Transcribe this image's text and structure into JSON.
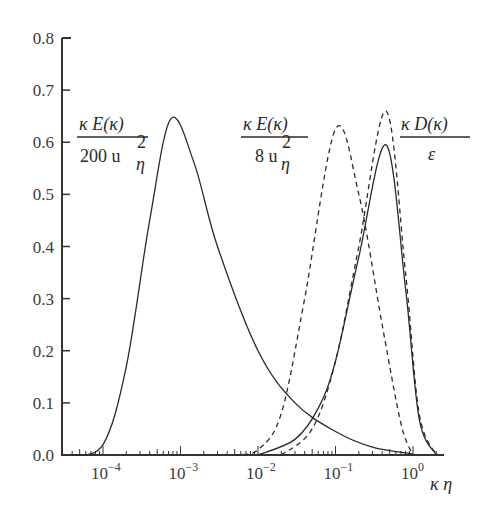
{
  "chart_data": {
    "type": "line",
    "title": "",
    "xlabel": "κ η",
    "ylabel": "",
    "xscale": "log",
    "xlim": [
      3e-05,
      3
    ],
    "ylim": [
      0.0,
      0.8
    ],
    "grid": false,
    "legend": "none (inline labels)",
    "y_ticks": [
      "0.0",
      "0.1",
      "0.2",
      "0.3",
      "0.4",
      "0.5",
      "0.6",
      "0.7",
      "0.8"
    ],
    "x_ticks": [
      {
        "base": "10",
        "exp": "−4",
        "value": 0.0001
      },
      {
        "base": "10",
        "exp": "−3",
        "value": 0.001
      },
      {
        "base": "10",
        "exp": "−2",
        "value": 0.01
      },
      {
        "base": "10",
        "exp": "−1",
        "value": 0.1
      },
      {
        "base": "10",
        "exp": "0",
        "value": 1
      }
    ],
    "series": [
      {
        "name": "κE(κ)/(200 u_η²) — high Re",
        "style": "solid",
        "label": {
          "num": "κ E(κ)",
          "den": "200 u",
          "den_sup": "2",
          "den_sub": "η"
        },
        "peak": {
          "x": 0.00075,
          "y": 0.645
        },
        "points": [
          [
            4e-05,
            0.0
          ],
          [
            0.0001,
            0.02
          ],
          [
            0.0002,
            0.17
          ],
          [
            0.0004,
            0.45
          ],
          [
            0.00075,
            0.645
          ],
          [
            0.0015,
            0.56
          ],
          [
            0.003,
            0.4
          ],
          [
            0.01,
            0.2
          ],
          [
            0.03,
            0.1
          ],
          [
            0.1,
            0.045
          ],
          [
            0.3,
            0.015
          ],
          [
            1,
            0.002
          ]
        ]
      },
      {
        "name": "κE(κ)/(8 u_η²) — low Re",
        "style": "dashed",
        "label": {
          "num": "κ E(κ)",
          "den": "8 u",
          "den_sup": "2",
          "den_sub": "η"
        },
        "peak": {
          "x": 0.1,
          "y": 0.625
        },
        "points": [
          [
            0.005,
            0.0
          ],
          [
            0.01,
            0.01
          ],
          [
            0.02,
            0.08
          ],
          [
            0.04,
            0.3
          ],
          [
            0.1,
            0.625
          ],
          [
            0.2,
            0.5
          ],
          [
            0.4,
            0.25
          ],
          [
            0.7,
            0.06
          ],
          [
            1,
            0.0
          ]
        ]
      },
      {
        "name": "κD(κ)/ε — low Re",
        "style": "dashed",
        "peak": {
          "x": 0.45,
          "y": 0.66
        },
        "points": [
          [
            0.02,
            0.0
          ],
          [
            0.05,
            0.05
          ],
          [
            0.1,
            0.18
          ],
          [
            0.2,
            0.4
          ],
          [
            0.45,
            0.66
          ],
          [
            0.8,
            0.35
          ],
          [
            1.2,
            0.08
          ],
          [
            2,
            0.0
          ]
        ]
      },
      {
        "name": "κD(κ)/ε — high Re",
        "style": "solid",
        "label": {
          "num": "κ D(κ)",
          "den": "ε"
        },
        "peak": {
          "x": 0.45,
          "y": 0.595
        },
        "points": [
          [
            0.01,
            0.0
          ],
          [
            0.03,
            0.03
          ],
          [
            0.06,
            0.09
          ],
          [
            0.1,
            0.18
          ],
          [
            0.2,
            0.38
          ],
          [
            0.45,
            0.595
          ],
          [
            0.8,
            0.32
          ],
          [
            1.2,
            0.07
          ],
          [
            2,
            0.0
          ]
        ]
      }
    ]
  },
  "labels": {
    "label1_num": "κ E(κ)",
    "label1_den": "200 u",
    "label2_num": "κ E(κ)",
    "label2_den": "8 u",
    "label3_num": "κ D(κ)",
    "label3_den": "ε",
    "sup2": "2",
    "sub_eta": "η",
    "xaxis": "κ η"
  },
  "colors": {
    "axis": "#333333",
    "curve": "#2a2a2a",
    "text": "#3a3a3a"
  }
}
